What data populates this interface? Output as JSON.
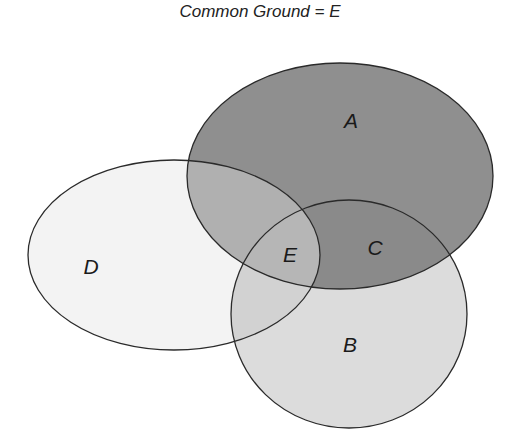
{
  "title": "Common Ground = E",
  "regions": {
    "A": {
      "label": "A",
      "fill": "#8f8f8f"
    },
    "B": {
      "label": "B",
      "fill": "#dcdcdc"
    },
    "C": {
      "label": "C",
      "fill": "#8a8a8a"
    },
    "D": {
      "label": "D",
      "fill": "#f3f3f3"
    },
    "E": {
      "label": "E",
      "fill": "#b6b6b6"
    }
  },
  "colors": {
    "outline": "#2a2a2a",
    "a_and_d": "#b0b0b0",
    "background": "#ffffff"
  }
}
